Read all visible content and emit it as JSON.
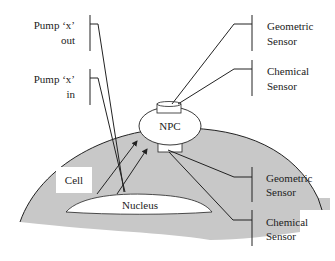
{
  "diagram": {
    "labels": {
      "pump_out_line1": "Pump ‘x’",
      "pump_out_line2": "out",
      "pump_in_line1": "Pump ‘x’",
      "pump_in_line2": "in",
      "geo_top_line1": "Geometric",
      "geo_top_line2": "Sensor",
      "chem_top_line1": "Chemical",
      "chem_top_line2": "Sensor",
      "npc": "NPC",
      "cell": "Cell",
      "nucleus": "Nucleus",
      "geo_bottom_line1": "Geometric",
      "geo_bottom_line2": "Sensor",
      "chem_bottom_line1": "Chemical",
      "chem_bottom_line2": "Sensor"
    },
    "colors": {
      "cell_fill": "#c8c8c8",
      "line": "#222222",
      "white": "#ffffff"
    }
  }
}
